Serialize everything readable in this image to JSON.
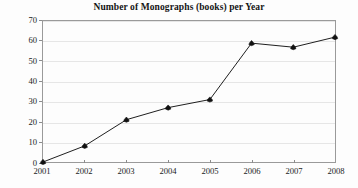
{
  "chart_data": {
    "type": "line",
    "title": "Number of Monographs (books) per Year",
    "xlabel": "",
    "ylabel": "",
    "categories": [
      "2001",
      "2002",
      "2003",
      "2004",
      "2005",
      "2006",
      "2007",
      "2008"
    ],
    "values": [
      0,
      8,
      21,
      27,
      31,
      59,
      57,
      62
    ],
    "x": [
      2001,
      2002,
      2003,
      2004,
      2005,
      2006,
      2007,
      2008
    ],
    "ylim": [
      0,
      70
    ],
    "ytick_labels": [
      "0",
      "10",
      "20",
      "30",
      "40",
      "50",
      "60",
      "70"
    ],
    "ytick_values": [
      0,
      10,
      20,
      30,
      40,
      50,
      60,
      70
    ],
    "grid": "horizontal",
    "legend": "none",
    "marker": "diamond",
    "line_color": "#1c1c1c",
    "marker_color": "#111111",
    "grid_color": "#e6e6e6",
    "frame_color": "#9a9a9a",
    "background_color": "#fdfdfd"
  }
}
